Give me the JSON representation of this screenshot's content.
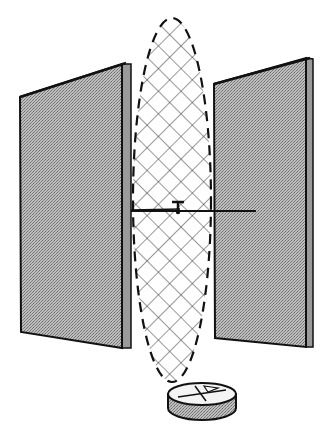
{
  "figure": {
    "elements": [
      {
        "name": "left-plate",
        "type": "panel",
        "fill": "stippled-gray"
      },
      {
        "name": "right-plate",
        "type": "panel",
        "fill": "stippled-gray"
      },
      {
        "name": "field-region",
        "type": "dashed-ellipse",
        "fill": "cross-hatch"
      },
      {
        "name": "horizontal-rod",
        "type": "line"
      },
      {
        "name": "pivot",
        "type": "t-shape"
      },
      {
        "name": "compass-disk",
        "type": "cylinder"
      }
    ],
    "text_labels": []
  },
  "colors": {
    "background": "#ffffff",
    "plate_fill": "#a8a8a8",
    "plate_edge": "#8c8c8c",
    "outline": "#111111",
    "hatch": "#333333",
    "disk_side": "#b0b0b0",
    "disk_top": "#f4f4f4"
  }
}
